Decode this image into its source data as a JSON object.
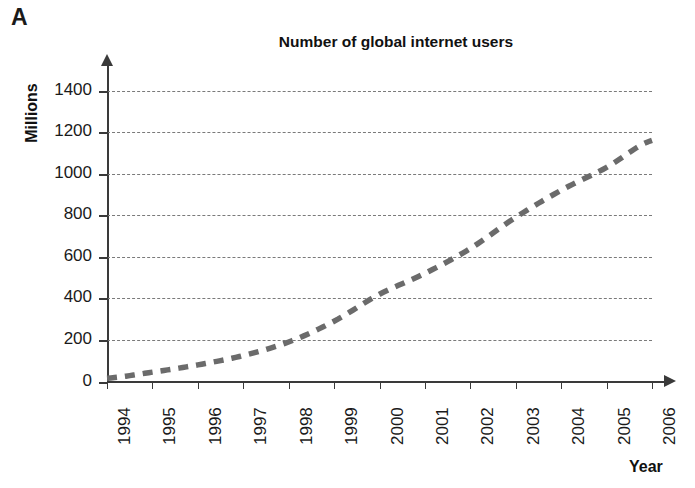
{
  "panel": {
    "label": "A"
  },
  "axes": {
    "x_title": "Year",
    "y_title": "Millions"
  },
  "chart_data": {
    "type": "line",
    "title": "Number of global internet users",
    "xlabel": "Year",
    "ylabel": "Millions",
    "xlim": [
      1994,
      2006
    ],
    "ylim": [
      0,
      1400
    ],
    "grid": true,
    "legend": "none",
    "line_style": "dashed",
    "line_color": "#6b6b6b",
    "x": [
      1994,
      1995,
      1996,
      1997,
      1998,
      1999,
      2000,
      2001,
      2002,
      2003,
      2004,
      2005,
      2006
    ],
    "categories": [
      "1994",
      "1995",
      "1996",
      "1997",
      "1998",
      "1999",
      "2000",
      "2001",
      "2002",
      "2003",
      "2004",
      "2005",
      "2006"
    ],
    "values": [
      16,
      45,
      80,
      125,
      190,
      290,
      420,
      520,
      640,
      790,
      920,
      1030,
      1160
    ],
    "ytick_labels": [
      "1400",
      "1200",
      "1000",
      "800",
      "600",
      "400",
      "200",
      "0"
    ],
    "ytick_values": [
      1400,
      1200,
      1000,
      800,
      600,
      400,
      200,
      0
    ],
    "ytick_step": 200
  }
}
